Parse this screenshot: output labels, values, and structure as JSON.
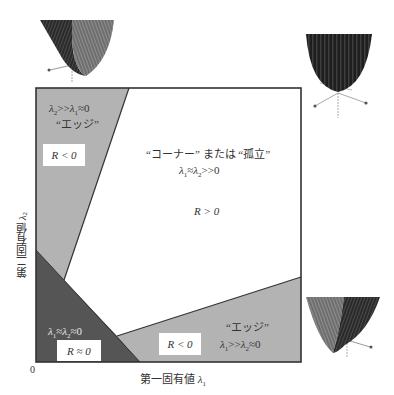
{
  "figure": {
    "title": "",
    "axes": {
      "x_label": "第一固有値 λ₁",
      "x_label_text": "第一固有値 ",
      "x_label_symbol": "λ",
      "x_label_sub": "1",
      "y_label": "第二固有値 λ₂",
      "y_label_text": "第二固有値 ",
      "y_label_symbol": "λ",
      "y_label_sub": "2",
      "origin": "0"
    },
    "regions": [
      {
        "id": "edge-vertical",
        "name": "エッジ",
        "quote_label": "“エッジ”",
        "condition": "λ₂ >> λ₁ ≈ 0",
        "r_label": "R < 0",
        "fill": "#b3b3b3"
      },
      {
        "id": "corner",
        "name": "コーナー または 孤立",
        "quote_label": "“コーナー” または “孤立”",
        "condition": "λ₁ ≈ λ₂ >> 0",
        "r_label": "R > 0",
        "fill": "#ffffff"
      },
      {
        "id": "flat",
        "name": "flat",
        "condition": "λ₁ ≈ λ₂ ≈ 0",
        "r_label": "R ≈ 0",
        "fill": "#555555"
      },
      {
        "id": "edge-horizontal",
        "name": "エッジ",
        "quote_label": "“エッジ”",
        "condition": "λ₁ >> λ₂ ≈ 0",
        "r_label": "R < 0",
        "fill": "#b3b3b3"
      }
    ],
    "surface_icons": [
      {
        "id": "surface-vertical-edge",
        "description": "valley surface (edge along λ₂)"
      },
      {
        "id": "surface-corner",
        "description": "bowl surface (corner)"
      },
      {
        "id": "surface-horizontal-edge",
        "description": "valley surface (edge along λ₁)"
      }
    ],
    "colors": {
      "border": "#333333",
      "edge_region": "#b3b3b3",
      "flat_region": "#555555",
      "corner_region": "#ffffff",
      "surface_dark": "#2a2a2a",
      "surface_mid": "#707070",
      "arrow": "#999999"
    }
  }
}
